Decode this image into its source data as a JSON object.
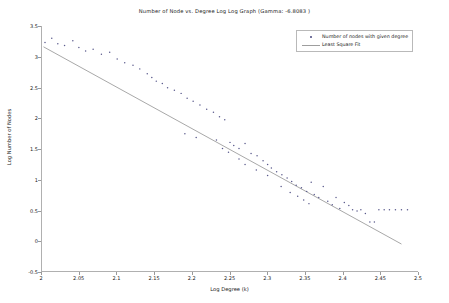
{
  "chart_data": {
    "type": "scatter",
    "title": "Number of Node vs. Degree Log Log Graph (Gamma: -6.8083 )",
    "xlabel": "Log Degree (k)",
    "ylabel": "Log Number of Nodes",
    "xlim": [
      2.0,
      2.5
    ],
    "ylim": [
      -0.5,
      3.5
    ],
    "grid": false,
    "legend_position": "upper right",
    "xticks": [
      "2",
      "2.05",
      "2.1",
      "2.15",
      "2.2",
      "2.25",
      "2.3",
      "2.35",
      "2.4",
      "2.45",
      "2.5"
    ],
    "xtick_values": [
      2.0,
      2.05,
      2.1,
      2.15,
      2.2,
      2.25,
      2.3,
      2.35,
      2.4,
      2.45,
      2.5
    ],
    "yticks": [
      "-0.5",
      "0",
      "0.5",
      "1",
      "1.5",
      "2",
      "2.5",
      "3",
      "3.5"
    ],
    "ytick_values": [
      -0.5,
      0,
      0.5,
      1,
      1.5,
      2,
      2.5,
      3,
      3.5
    ],
    "series": [
      {
        "name": "Number of nodes with given degree",
        "type": "scatter",
        "marker": "point",
        "color": "#5a5a8c",
        "points": [
          [
            2.004,
            3.23
          ],
          [
            2.013,
            3.3
          ],
          [
            2.021,
            3.21
          ],
          [
            2.03,
            3.18
          ],
          [
            2.041,
            3.26
          ],
          [
            2.049,
            3.15
          ],
          [
            2.058,
            3.09
          ],
          [
            2.068,
            3.12
          ],
          [
            2.079,
            3.04
          ],
          [
            2.09,
            3.07
          ],
          [
            2.1,
            2.96
          ],
          [
            2.11,
            2.9
          ],
          [
            2.121,
            2.86
          ],
          [
            2.13,
            2.8
          ],
          [
            2.14,
            2.72
          ],
          [
            2.146,
            2.66
          ],
          [
            2.152,
            2.6
          ],
          [
            2.16,
            2.56
          ],
          [
            2.167,
            2.49
          ],
          [
            2.176,
            2.45
          ],
          [
            2.185,
            2.4
          ],
          [
            2.193,
            2.32
          ],
          [
            2.201,
            2.27
          ],
          [
            2.21,
            2.21
          ],
          [
            2.219,
            2.14
          ],
          [
            2.228,
            2.09
          ],
          [
            2.236,
            2.02
          ],
          [
            2.243,
            1.97
          ],
          [
            2.25,
            1.6
          ],
          [
            2.255,
            1.55
          ],
          [
            2.262,
            1.5
          ],
          [
            2.27,
            1.58
          ],
          [
            2.278,
            1.42
          ],
          [
            2.286,
            1.38
          ],
          [
            2.294,
            1.3
          ],
          [
            2.3,
            1.24
          ],
          [
            2.305,
            1.18
          ],
          [
            2.312,
            1.12
          ],
          [
            2.319,
            1.07
          ],
          [
            2.326,
            1.02
          ],
          [
            2.332,
            0.96
          ],
          [
            2.338,
            0.9
          ],
          [
            2.345,
            0.86
          ],
          [
            2.352,
            0.8
          ],
          [
            2.358,
            0.95
          ],
          [
            2.362,
            0.75
          ],
          [
            2.368,
            0.7
          ],
          [
            2.374,
            0.88
          ],
          [
            2.38,
            0.64
          ],
          [
            2.386,
            0.58
          ],
          [
            2.391,
            0.7
          ],
          [
            2.396,
            0.52
          ],
          [
            2.402,
            0.62
          ],
          [
            2.408,
            0.57
          ],
          [
            2.413,
            0.5
          ],
          [
            2.419,
            0.48
          ],
          [
            2.424,
            0.5
          ],
          [
            2.43,
            0.44
          ],
          [
            2.436,
            0.3
          ],
          [
            2.442,
            0.3
          ],
          [
            2.448,
            0.5
          ],
          [
            2.455,
            0.5
          ],
          [
            2.462,
            0.5
          ],
          [
            2.47,
            0.5
          ],
          [
            2.478,
            0.5
          ],
          [
            2.486,
            0.5
          ],
          [
            2.19,
            1.74
          ],
          [
            2.205,
            1.68
          ],
          [
            2.232,
            1.64
          ],
          [
            2.24,
            1.5
          ],
          [
            2.248,
            1.44
          ],
          [
            2.262,
            1.33
          ],
          [
            2.27,
            1.24
          ],
          [
            2.285,
            1.15
          ],
          [
            2.3,
            1.06
          ],
          [
            2.318,
            0.88
          ],
          [
            2.33,
            0.78
          ],
          [
            2.34,
            0.72
          ],
          [
            2.348,
            0.66
          ],
          [
            2.355,
            0.6
          ]
        ]
      },
      {
        "name": "Least Square Fit",
        "type": "line",
        "color": "#9e9e9e",
        "endpoints": [
          [
            2.002,
            3.16
          ],
          [
            2.478,
            -0.06
          ]
        ]
      }
    ]
  },
  "legend": {
    "items": [
      {
        "label": "Number of nodes with given degree",
        "key": "point"
      },
      {
        "label": "Least Square Fit",
        "key": "line"
      }
    ]
  }
}
